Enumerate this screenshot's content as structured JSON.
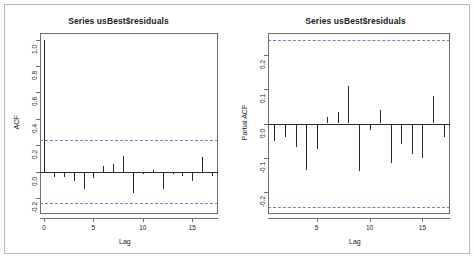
{
  "figure": {
    "background": "#ffffff",
    "frame_color": "#b9b9b9",
    "bar_color": "#2b2b2b",
    "confidence_band_color": "#4f6fd0",
    "axis_color": "#6e6e6e"
  },
  "panels": {
    "acf": {
      "title": "Series  usBest$residuals",
      "ylabel": "ACF",
      "xlabel": "Lag",
      "ytick_labels": [
        "1.0",
        "0.8",
        "0.6",
        "0.4",
        "0.2",
        "0.0",
        "-0.2"
      ],
      "xtick_labels": [
        "0",
        "5",
        "10",
        "15"
      ]
    },
    "pacf": {
      "title": "Series  usBest$residuals",
      "ylabel": "Partial ACF",
      "xlabel": "Lag",
      "ytick_labels": [
        "0.2",
        "0.1",
        "0.0",
        "-0.1",
        "-0.2"
      ],
      "xtick_labels": [
        "5",
        "10",
        "15"
      ]
    }
  },
  "chart_data": [
    {
      "type": "bar",
      "name": "acf",
      "title": "Series  usBest$residuals",
      "xlabel": "Lag",
      "ylabel": "ACF",
      "categories": [
        0,
        1,
        2,
        3,
        4,
        5,
        6,
        7,
        8,
        9,
        10,
        11,
        12,
        13,
        14,
        15,
        16,
        17
      ],
      "values": [
        1.0,
        -0.04,
        -0.04,
        -0.07,
        -0.13,
        -0.05,
        0.04,
        0.06,
        0.12,
        -0.16,
        -0.02,
        0.015,
        -0.13,
        -0.015,
        -0.035,
        -0.07,
        0.11,
        -0.03
      ],
      "ylim": [
        -0.32,
        1.05
      ],
      "xlim": [
        -0.4,
        17.6
      ],
      "yticks": [
        1.0,
        0.8,
        0.6,
        0.4,
        0.2,
        0.0,
        -0.2
      ],
      "xticks": [
        0,
        5,
        10,
        15
      ],
      "grid": false,
      "confidence_bands": [
        0.24,
        -0.24
      ],
      "zero_line": 0.0
    },
    {
      "type": "bar",
      "name": "pacf",
      "title": "Series  usBest$residuals",
      "xlabel": "Lag",
      "ylabel": "Partial ACF",
      "categories": [
        1,
        2,
        3,
        4,
        5,
        6,
        7,
        8,
        9,
        10,
        11,
        12,
        13,
        14,
        15,
        16,
        17
      ],
      "values": [
        -0.05,
        -0.04,
        -0.07,
        -0.135,
        -0.075,
        0.02,
        0.035,
        0.11,
        -0.14,
        -0.02,
        0.04,
        -0.115,
        -0.06,
        -0.09,
        -0.1,
        0.08,
        -0.04
      ],
      "ylim": [
        -0.265,
        0.265
      ],
      "xlim": [
        0.4,
        17.6
      ],
      "yticks": [
        0.2,
        0.1,
        0.0,
        -0.1,
        -0.2
      ],
      "xticks": [
        5,
        10,
        15
      ],
      "grid": false,
      "confidence_bands": [
        0.245,
        -0.245
      ],
      "zero_line": 0.0
    }
  ]
}
